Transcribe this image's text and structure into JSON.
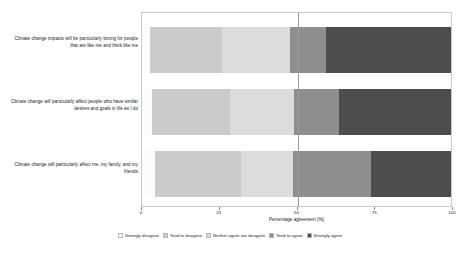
{
  "chart_data": {
    "type": "bar",
    "orientation": "horizontal",
    "stacked": true,
    "stack_mode": "percent",
    "title": "",
    "xlabel": "Percentage agreement (%)",
    "ylabel": "",
    "xlim": [
      0,
      100
    ],
    "xticks": [
      0,
      25,
      50,
      75,
      100
    ],
    "xtick_labels": [
      "0",
      "25",
      "50",
      "75",
      "100"
    ],
    "grid": false,
    "reference_line": 50,
    "legend_position": "bottom",
    "categories": [
      "Climate change impacts will be particularly strong for people that are like me and think like me",
      "Climate change will particularly affect people who have similar desires and goals in life as I do",
      "Climate change will particularly affect me, my family, and my friends"
    ],
    "series": [
      {
        "name": "Strongly disagree",
        "color": "#fcfcfc",
        "values": [
          2.6,
          3.2,
          4.2
        ]
      },
      {
        "name": "Tend to disagree",
        "color": "#cbcbcb",
        "values": [
          23.1,
          25.1,
          27.6
        ]
      },
      {
        "name": "Neither agree nor disagree",
        "color": "#dcdcdc",
        "values": [
          21.9,
          20.6,
          16.8
        ]
      },
      {
        "name": "Tend to agree",
        "color": "#8e8e8e",
        "values": [
          11.6,
          14.4,
          25.0
        ]
      },
      {
        "name": "Strongly agree",
        "color": "#4d4d4d",
        "values": [
          40.8,
          36.7,
          26.4
        ]
      }
    ]
  },
  "legend": {
    "items": [
      {
        "label": "Strongly disagree"
      },
      {
        "label": "Tend to disagree"
      },
      {
        "label": "Neither agree nor disagree"
      },
      {
        "label": "Tend to agree"
      },
      {
        "label": "Strongly agree"
      }
    ]
  }
}
